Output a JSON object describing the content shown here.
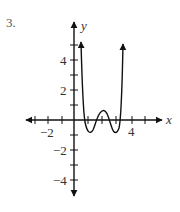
{
  "problem": {
    "number": "3."
  },
  "axes": {
    "x_label": "x",
    "y_label": "y",
    "x_tick_labels": [
      {
        "value": -2,
        "text": "−2"
      },
      {
        "value": 4,
        "text": "4"
      }
    ],
    "y_tick_labels": [
      {
        "value": 4,
        "text": "4"
      },
      {
        "value": 2,
        "text": "2"
      },
      {
        "value": -2,
        "text": "−2"
      },
      {
        "value": -4,
        "text": "−4"
      }
    ],
    "x_range": [
      -3.5,
      5.5
    ],
    "y_range": [
      -5,
      6.5
    ]
  },
  "curve": {
    "description": "Polynomial with arrows up at both ends, crossing x-axis near 0.5, 1.5, 2.5, 3.5",
    "approx_points": [
      [
        0.5,
        5.3
      ],
      [
        0.6,
        2
      ],
      [
        0.7,
        0
      ],
      [
        1,
        -1
      ],
      [
        1.5,
        0
      ],
      [
        2,
        0.6
      ],
      [
        2.5,
        0
      ],
      [
        3,
        -1
      ],
      [
        3.3,
        0
      ],
      [
        3.4,
        2
      ],
      [
        3.5,
        5.1
      ]
    ]
  }
}
